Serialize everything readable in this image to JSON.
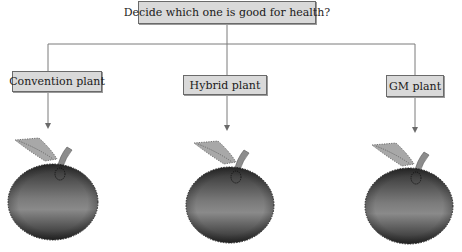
{
  "diagram": {
    "question": "Decide which one is good for health?",
    "options": [
      {
        "label": "Convention plant",
        "image": "apple-icon"
      },
      {
        "label": "Hybrid plant",
        "image": "apple-icon"
      },
      {
        "label": "GM plant",
        "image": "apple-icon"
      }
    ]
  },
  "colors": {
    "box_fill": "#d9d9d9",
    "box_border": "#6a6a6a",
    "connector": "#7a7a7a",
    "apple_dark": "#2e2e2e",
    "apple_mid": "#8a8a8a",
    "leaf": "#a8a8a8",
    "stem": "#8c8c8c"
  }
}
